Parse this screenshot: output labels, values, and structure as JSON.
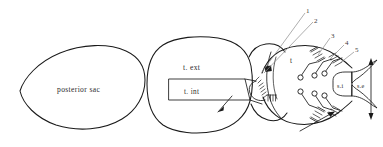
{
  "figure": {
    "type": "schematic-line-drawing",
    "title": "",
    "background_color": "#ffffff",
    "ink_color": "#1a1a1a",
    "leader_color": "#8b8b8b",
    "labels": {
      "posterior_sac": "posterior sac",
      "tunica_externa": "t. ext",
      "tunica_interna": "t. int",
      "chamber_t": "t",
      "siphon_internal": "s.i",
      "siphon_external": "s.e"
    },
    "callouts": [
      {
        "id": "1",
        "label": "1"
      },
      {
        "id": "2",
        "label": "2"
      },
      {
        "id": "3",
        "label": "3"
      },
      {
        "id": "4",
        "label": "4"
      },
      {
        "id": "5",
        "label": "5"
      }
    ],
    "arrows": [
      {
        "name": "inflow-arrow",
        "direction": "down-left"
      },
      {
        "name": "outflow-arrow",
        "direction": "up-right"
      },
      {
        "name": "range-arrow",
        "direction": "vertical-double"
      }
    ]
  }
}
